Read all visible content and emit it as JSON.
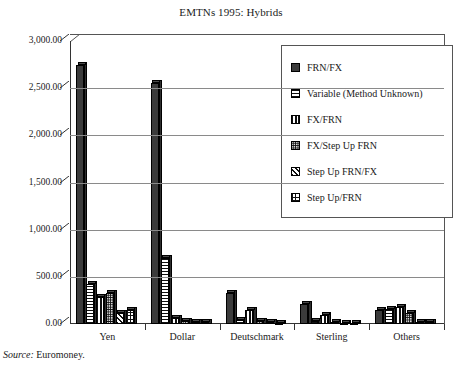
{
  "figure": {
    "title": "EMTNs 1995: Hybrids",
    "source_label": "Source:",
    "source_value": "Euromoney."
  },
  "axes": {
    "y_ticks": [
      "3,000.00",
      "2,500.00",
      "2,000.00",
      "1,500.00",
      "1,000.00",
      "500.00",
      "0.00"
    ],
    "x_ticks": [
      "Yen",
      "Dollar",
      "Deutschmark",
      "Sterling",
      "Others"
    ]
  },
  "legend": {
    "items": [
      {
        "label": "FRN/FX",
        "pattern": "solid-dark",
        "color": "#3b3b3b"
      },
      {
        "label": "Variable (Method Unknown)",
        "pattern": "horizontal-lines",
        "color": "#6b6b6b"
      },
      {
        "label": "FX/FRN",
        "pattern": "vertical-lines",
        "color": "#777777"
      },
      {
        "label": "FX/Step Up FRN",
        "pattern": "dense-dots",
        "color": "#888888"
      },
      {
        "label": "Step Up FRN/FX",
        "pattern": "diagonal-hatch",
        "color": "#7d7d7d"
      },
      {
        "label": "Step Up/FRN",
        "pattern": "grid",
        "color": "#8a8a8a"
      }
    ]
  },
  "chart_data": {
    "type": "bar",
    "title": "EMTNs 1995: Hybrids",
    "xlabel": "",
    "ylabel": "",
    "ylim": [
      0,
      3000
    ],
    "ytick_step": 500,
    "grid": true,
    "legend_position": "inside-upper-right",
    "categories": [
      "Yen",
      "Dollar",
      "Deutschmark",
      "Sterling",
      "Others"
    ],
    "series": [
      {
        "name": "FRN/FX",
        "values": [
          2750,
          2550,
          330,
          215,
          145
        ]
      },
      {
        "name": "Variable (Method Unknown)",
        "values": [
          425,
          700,
          40,
          35,
          160
        ]
      },
      {
        "name": "FX/FRN",
        "values": [
          290,
          60,
          150,
          95,
          175
        ]
      },
      {
        "name": "FX/Step Up FRN",
        "values": [
          330,
          35,
          30,
          20,
          120
        ]
      },
      {
        "name": "Step Up FRN/FX",
        "values": [
          120,
          20,
          20,
          15,
          25
        ]
      },
      {
        "name": "Step Up/FRN",
        "values": [
          145,
          25,
          15,
          10,
          20
        ]
      }
    ]
  }
}
